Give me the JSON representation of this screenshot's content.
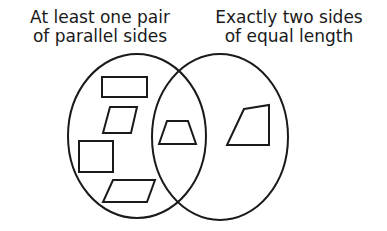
{
  "diagram": {
    "type": "venn",
    "sets": [
      {
        "id": "left",
        "label_lines": [
          "At least one pair",
          "of parallel sides"
        ],
        "ellipse": {
          "cx": 137,
          "cy": 136,
          "rx": 69,
          "ry": 82
        }
      },
      {
        "id": "right",
        "label_lines": [
          "Exactly two sides",
          "of equal length"
        ],
        "ellipse": {
          "cx": 220,
          "cy": 137,
          "rx": 68,
          "ry": 83
        }
      }
    ],
    "shapes": [
      {
        "name": "rectangle",
        "region": "left-only",
        "points": "102,77 147,77 147,97 102,97"
      },
      {
        "name": "parallelogram-upper",
        "region": "left-only",
        "points": "110,107 137,107 131,133 103,133"
      },
      {
        "name": "square",
        "region": "left-only",
        "points": "79,141 113,141 113,172 79,172"
      },
      {
        "name": "parallelogram-lower",
        "region": "left-only",
        "points": "113,180 155,180 147,202 103,202"
      },
      {
        "name": "isosceles-trapezoid",
        "region": "intersection",
        "points": "167,121 188,121 196,144 159,144"
      },
      {
        "name": "irregular-quadrilateral",
        "region": "right-only",
        "points": "244,109 269,105 269,145 227,145"
      }
    ],
    "colors": {
      "stroke": "#1a1a1a",
      "background": "#ffffff"
    }
  }
}
